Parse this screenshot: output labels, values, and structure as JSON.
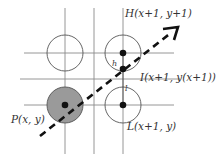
{
  "diagram": {
    "labels": {
      "H": "H(x+1, y+1)",
      "I": "I(x+1, y(x+1))",
      "P": "P(x, y)",
      "L": "L(x+1, y)",
      "h": "h",
      "l": "l"
    },
    "colors": {
      "grid": "#8a8a8a",
      "filled_pixel": "#9a9a9a",
      "line": "#111111",
      "text": "#333333"
    }
  }
}
